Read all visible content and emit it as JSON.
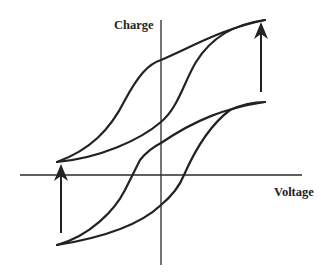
{
  "diagram": {
    "type": "hysteresis-loops",
    "y_axis_label": "Charge",
    "x_axis_label": "Voltage",
    "colors": {
      "line": "#222222",
      "background": "#ffffff"
    },
    "loops": [
      {
        "name": "upper-loop",
        "left_endpoint": [
          57,
          162
        ],
        "right_endpoint": [
          265,
          20
        ]
      },
      {
        "name": "lower-loop",
        "left_endpoint": [
          57,
          245
        ],
        "right_endpoint": [
          265,
          102
        ]
      }
    ],
    "arrows": [
      {
        "name": "right-arrow-up",
        "from": [
          261,
          92
        ],
        "to": [
          261,
          22
        ]
      },
      {
        "name": "left-arrow-up",
        "from": [
          61,
          233
        ],
        "to": [
          61,
          164
        ]
      }
    ]
  }
}
